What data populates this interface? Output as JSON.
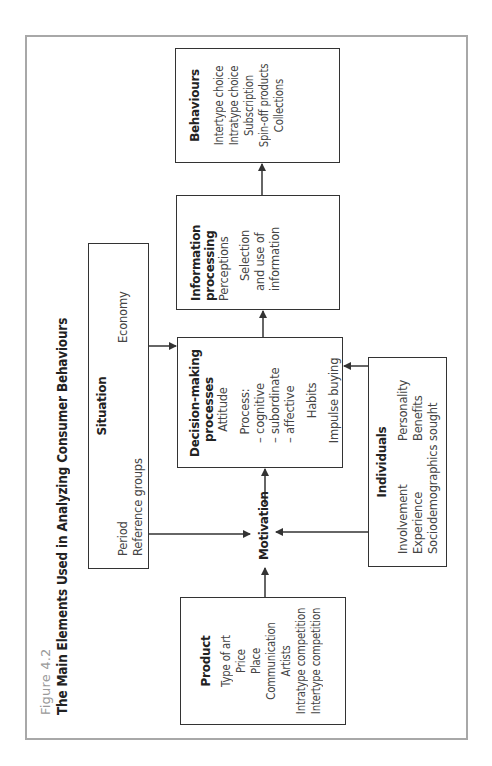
{
  "figure": {
    "number": "Figure 4.2",
    "title": "The Main Elements Used in Analyzing Consumer Behaviours"
  },
  "colors": {
    "frame": "#a8a8a8",
    "box_border": "#333333",
    "figure_number": "#9a9a9a",
    "text": "#222222"
  },
  "nodes": {
    "product": {
      "title": "Product",
      "items": [
        "Type of art",
        "Price",
        "Place",
        "Communication",
        "Artists",
        "Intratype competition",
        "Intertype competition"
      ]
    },
    "situation": {
      "title": "Situation",
      "items_left": [
        "Period",
        "Reference groups"
      ],
      "items_right": [
        "Economy"
      ]
    },
    "motivation": {
      "label": "Motivation"
    },
    "decision": {
      "title_line1": "Decision-making",
      "title_line2": "processes",
      "items": {
        "attitude": "Attitude",
        "process": "Process:",
        "cognitive": "– cognitive",
        "subordinate": "– subordinate",
        "affective": "– affective",
        "habits": "Habits",
        "impulse": "Impulse buying"
      }
    },
    "information": {
      "title_line1": "Information",
      "title_line2": "processing",
      "items": {
        "perceptions": "Perceptions",
        "selection1": "Selection",
        "selection2": "and use of",
        "selection3": "information"
      }
    },
    "behaviours": {
      "title": "Behaviours",
      "items": [
        "Intertype choice",
        "Intratype choice",
        "Subscription",
        "Spin-off products",
        "Collections"
      ]
    },
    "individuals": {
      "title": "Individuals",
      "items_left": [
        "Involvement",
        "Experience",
        "Sociodemographics"
      ],
      "items_right": [
        "Personality",
        "Benefits sought"
      ]
    }
  },
  "edges": [
    {
      "from": "Product",
      "to": "Motivation"
    },
    {
      "from": "Situation",
      "to": "Motivation"
    },
    {
      "from": "Individuals",
      "to": "Motivation"
    },
    {
      "from": "Motivation",
      "to": "Decision-making processes"
    },
    {
      "from": "Situation",
      "to": "Decision-making processes"
    },
    {
      "from": "Individuals",
      "to": "Decision-making processes"
    },
    {
      "from": "Decision-making processes",
      "to": "Information processing"
    },
    {
      "from": "Information processing",
      "to": "Behaviours"
    }
  ]
}
